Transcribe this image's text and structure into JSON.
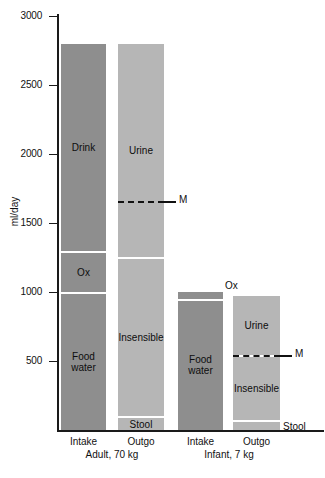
{
  "chart_data": {
    "type": "bar",
    "title": "",
    "subtitle": "",
    "xlabel": "",
    "ylabel": "ml/day",
    "ylim": [
      0,
      3000
    ],
    "yticks": [
      0,
      500,
      1000,
      1500,
      2000,
      2500,
      3000
    ],
    "ytick_labels": [
      "",
      "500",
      "1000",
      "1500",
      "2000",
      "2500",
      "3000"
    ],
    "grid": false,
    "legend": "none",
    "stacked": true,
    "groups": [
      {
        "name": "Adult, 70 kg",
        "bars": [
          {
            "name": "Intake",
            "total": 2800,
            "shade": "dark",
            "segments": [
              {
                "label": "Drink",
                "value": 1500,
                "from": 1300,
                "to": 2800,
                "label_position": "inside"
              },
              {
                "label": "Ox",
                "value": 300,
                "from": 1000,
                "to": 1300,
                "label_position": "inside"
              },
              {
                "label": "Food\nwater",
                "value": 1000,
                "from": 0,
                "to": 1000,
                "label_position": "inside"
              }
            ]
          },
          {
            "name": "Outgo",
            "total": 2800,
            "shade": "light",
            "marker": {
              "label": "M",
              "value": 1660
            },
            "segments": [
              {
                "label": "Urine",
                "value": 1550,
                "from": 1250,
                "to": 2800,
                "label_position": "inside"
              },
              {
                "label": "Insensible",
                "value": 1150,
                "from": 100,
                "to": 1250,
                "label_position": "inside"
              },
              {
                "label": "Stool",
                "value": 100,
                "from": 0,
                "to": 100,
                "label_position": "inside"
              }
            ]
          }
        ]
      },
      {
        "name": "Infant, 7 kg",
        "bars": [
          {
            "name": "Intake",
            "total": 1000,
            "shade": "dark",
            "segments": [
              {
                "label": "Ox",
                "value": 50,
                "from": 950,
                "to": 1000,
                "label_position": "outside-above"
              },
              {
                "label": "Food\nwater",
                "value": 950,
                "from": 0,
                "to": 950,
                "label_position": "inside"
              }
            ]
          },
          {
            "name": "Outgo",
            "total": 970,
            "shade": "light",
            "marker": {
              "label": "M",
              "value": 545
            },
            "segments": [
              {
                "label": "Urine",
                "value": 430,
                "from": 540,
                "to": 970,
                "label_position": "inside"
              },
              {
                "label": "Insensible",
                "value": 470,
                "from": 70,
                "to": 540,
                "label_position": "inside"
              },
              {
                "label": "Stool",
                "value": 70,
                "from": 0,
                "to": 70,
                "label_position": "outside-right"
              }
            ]
          }
        ]
      }
    ],
    "colors": {
      "bar_dark": "#8e8e8e",
      "bar_light": "#b6b6b6",
      "axis": "#1a1a1a",
      "separator": "#ffffff",
      "text": "#111111",
      "background": "#ffffff"
    }
  },
  "axis": {
    "y_title": "ml/day",
    "ticks": [
      {
        "label": "3000",
        "value": 3000
      },
      {
        "label": "2500",
        "value": 2500
      },
      {
        "label": "2000",
        "value": 2000
      },
      {
        "label": "1500",
        "value": 1500
      },
      {
        "label": "1000",
        "value": 1000
      },
      {
        "label": "500",
        "value": 500
      }
    ]
  }
}
